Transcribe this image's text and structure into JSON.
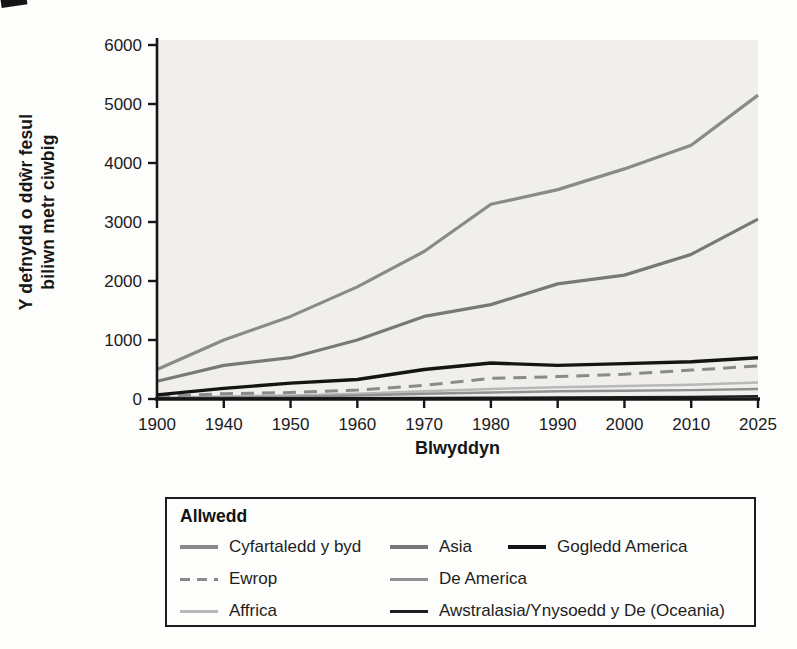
{
  "figure": {
    "ylabel_line1": "Y defnydd o ddŵr fesul",
    "ylabel_line2": "biliwn metr ciwbig",
    "xlabel": "Blwyddyn",
    "legend_title": "Allwedd"
  },
  "chart_data": {
    "type": "line",
    "title": "",
    "xlabel": "Blwyddyn",
    "ylabel": "Y defnydd o ddŵr fesul biliwn metr ciwbig",
    "categories": [
      "1900",
      "1940",
      "1950",
      "1960",
      "1970",
      "1980",
      "1990",
      "2000",
      "2010",
      "2025"
    ],
    "ylim": [
      0,
      6000
    ],
    "yticks": [
      0,
      1000,
      2000,
      3000,
      4000,
      5000,
      6000
    ],
    "grid": false,
    "legend_position": "below-chart-boxed",
    "legend_title": "Allwedd",
    "plot_bg": "#f0efec",
    "axis_color": "#161616",
    "series": [
      {
        "id": "cyfartaledd-y-byd",
        "name": "Cyfartaledd y byd",
        "color": "#8a8a8a",
        "width": 3.2,
        "dash": null,
        "values": [
          500,
          1000,
          1400,
          1900,
          2500,
          3300,
          3550,
          3900,
          4300,
          5150
        ]
      },
      {
        "id": "asia",
        "name": "Asia",
        "color": "#787878",
        "width": 3.2,
        "dash": null,
        "values": [
          300,
          570,
          700,
          1000,
          1400,
          1600,
          1950,
          2100,
          2450,
          3050
        ]
      },
      {
        "id": "gogledd-america",
        "name": "Gogledd America",
        "color": "#141414",
        "width": 3.4,
        "dash": null,
        "values": [
          70,
          180,
          270,
          330,
          500,
          610,
          570,
          600,
          630,
          700
        ]
      },
      {
        "id": "ewrop",
        "name": "Ewrop",
        "color": "#8a8a8a",
        "width": 3,
        "dash": "13 8",
        "values": [
          40,
          90,
          110,
          150,
          230,
          350,
          380,
          420,
          490,
          560
        ]
      },
      {
        "id": "de-america",
        "name": "De America",
        "color": "#909090",
        "width": 2.4,
        "dash": null,
        "values": [
          15,
          30,
          40,
          60,
          90,
          110,
          130,
          140,
          150,
          170
        ]
      },
      {
        "id": "affrica",
        "name": "Affrica",
        "color": "#b8b8b8",
        "width": 2.6,
        "dash": null,
        "values": [
          20,
          40,
          60,
          90,
          130,
          170,
          200,
          220,
          240,
          280
        ]
      },
      {
        "id": "awstralasia",
        "name": "Awstralasia/Ynysoedd y De (Oceania)",
        "color": "#1e1e1e",
        "width": 2.2,
        "dash": null,
        "values": [
          5,
          8,
          10,
          14,
          18,
          24,
          28,
          32,
          38,
          48
        ]
      }
    ],
    "draw_order": [
      5,
      4,
      1,
      0,
      3,
      2,
      6
    ],
    "legend_slots": [
      0,
      1,
      2,
      3,
      4,
      5,
      6
    ]
  }
}
